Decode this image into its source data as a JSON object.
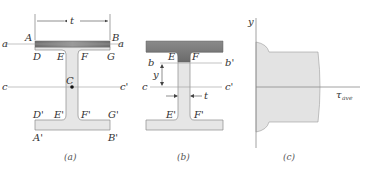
{
  "figures": {
    "a": {
      "caption": "(a)",
      "dimension_label": "t",
      "axis_a_left": "a",
      "axis_a_right": "a",
      "axis_c_left": "c",
      "axis_c_right": "c'",
      "centroid_label": "C",
      "points_top": [
        "A",
        "B",
        "D",
        "E",
        "F",
        "G"
      ],
      "labels": {
        "A": "A",
        "B": "B",
        "D": "D",
        "E": "E",
        "F": "F",
        "G": "G",
        "D2": "D'",
        "E2": "E'",
        "F2": "F'",
        "G2": "G'",
        "A2": "A'",
        "B2": "B'"
      }
    },
    "b": {
      "caption": "(b)",
      "axis_b_left": "b",
      "axis_b_right": "b'",
      "axis_c_left": "c",
      "axis_c_right": "c'",
      "y_label": "y",
      "t_label": "t",
      "labels": {
        "E": "E",
        "F": "F",
        "E2": "E'",
        "F2": "F'"
      }
    },
    "c": {
      "caption": "(c)",
      "y_axis_label": "y",
      "x_axis_label": "τ",
      "x_axis_sub": "ave"
    }
  },
  "colors": {
    "flange_dark": "#7a7a7a",
    "section_fill": "#e6e6e6",
    "outline": "#8a8a8a",
    "line": "#9a9a9a",
    "text": "#333333"
  }
}
